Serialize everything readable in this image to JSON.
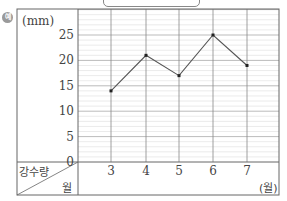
{
  "example_mark": "예",
  "chart_data": {
    "type": "line",
    "title": "",
    "xlabel": "월",
    "ylabel": "강수량",
    "y_unit": "(mm)",
    "x_unit": "(월)",
    "header_row_label": "강수량",
    "header_col_label": "월",
    "categories": [
      "3",
      "4",
      "5",
      "6",
      "7"
    ],
    "values": [
      14,
      21,
      17,
      25,
      19
    ],
    "y_ticks": [
      "0",
      "5",
      "10",
      "15",
      "20",
      "25"
    ],
    "ylim": [
      0,
      25
    ],
    "grid": true,
    "minor_grid_step": 1,
    "colors": {
      "line": "#555555",
      "grid_major": "#888888",
      "grid_minor": "#dddddd",
      "border": "#666666"
    }
  }
}
